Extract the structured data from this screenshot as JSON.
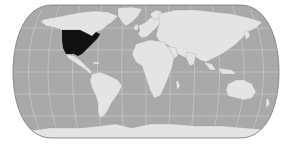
{
  "map": {
    "type": "world-locator-map",
    "projection": "pseudocylindrical (rounded-rectangle outline)",
    "highlighted_region": "United States (contiguous)",
    "colors": {
      "background": "#ffffff",
      "ocean": "#a9a9a9",
      "land": "#e4e4e4",
      "highlight": "#111111",
      "graticule": "#d0d0d0",
      "outline": "#7a7a7a"
    },
    "labels": []
  }
}
